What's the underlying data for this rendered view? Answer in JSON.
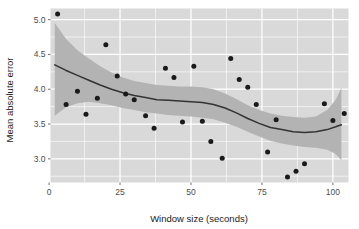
{
  "chart_data": {
    "type": "scatter",
    "title": "",
    "xlabel": "Window size (seconds)",
    "ylabel": "Mean absolute error",
    "xlim": [
      0.5,
      105.5
    ],
    "ylim": [
      2.66,
      5.16
    ],
    "xticks": [
      0,
      25,
      50,
      75,
      100
    ],
    "xticklabels": [
      "0",
      "25",
      "50",
      "75",
      "100"
    ],
    "yticks": [
      3.0,
      3.5,
      4.0,
      4.5,
      5.0
    ],
    "yticklabels": [
      "3.0",
      "3.5",
      "4.0",
      "4.5",
      "5.0"
    ],
    "x_minor_ticks": [
      12.5,
      37.5,
      62.5,
      87.5
    ],
    "y_minor_ticks": [
      2.75,
      3.25,
      3.75,
      4.25,
      4.75
    ],
    "grid": true,
    "legend": "none",
    "panel_background": "#d9d9d9",
    "gridline_color": "#ffffff",
    "point_color": "#1a1a1a",
    "line_color": "#333333",
    "ribbon_color": "#b3b3b3",
    "series": [
      {
        "name": "Mean absolute error",
        "points": [
          {
            "x": 3,
            "y": 5.08
          },
          {
            "x": 6,
            "y": 3.78
          },
          {
            "x": 10,
            "y": 3.97
          },
          {
            "x": 13,
            "y": 3.64
          },
          {
            "x": 17,
            "y": 3.87
          },
          {
            "x": 20,
            "y": 4.64
          },
          {
            "x": 24,
            "y": 4.19
          },
          {
            "x": 27,
            "y": 3.93
          },
          {
            "x": 30,
            "y": 3.85
          },
          {
            "x": 34,
            "y": 3.62
          },
          {
            "x": 37,
            "y": 3.44
          },
          {
            "x": 41,
            "y": 4.3
          },
          {
            "x": 44,
            "y": 4.17
          },
          {
            "x": 47,
            "y": 3.53
          },
          {
            "x": 51,
            "y": 4.33
          },
          {
            "x": 54,
            "y": 3.54
          },
          {
            "x": 57,
            "y": 3.25
          },
          {
            "x": 61,
            "y": 3.01
          },
          {
            "x": 64,
            "y": 4.44
          },
          {
            "x": 67,
            "y": 4.14
          },
          {
            "x": 70,
            "y": 4.03
          },
          {
            "x": 73,
            "y": 3.78
          },
          {
            "x": 77,
            "y": 3.1
          },
          {
            "x": 80,
            "y": 3.56
          },
          {
            "x": 84,
            "y": 2.74
          },
          {
            "x": 87,
            "y": 2.82
          },
          {
            "x": 90,
            "y": 2.93
          },
          {
            "x": 97,
            "y": 3.79
          },
          {
            "x": 100,
            "y": 3.55
          },
          {
            "x": 104,
            "y": 3.65
          }
        ],
        "smooth": [
          {
            "x": 2,
            "y": 4.35,
            "lo": 3.62,
            "hi": 4.95
          },
          {
            "x": 6,
            "y": 4.27,
            "lo": 3.74,
            "hi": 4.72
          },
          {
            "x": 10,
            "y": 4.2,
            "lo": 3.8,
            "hi": 4.56
          },
          {
            "x": 14,
            "y": 4.13,
            "lo": 3.82,
            "hi": 4.44
          },
          {
            "x": 18,
            "y": 4.06,
            "lo": 3.8,
            "hi": 4.33
          },
          {
            "x": 22,
            "y": 4.0,
            "lo": 3.77,
            "hi": 4.24
          },
          {
            "x": 26,
            "y": 3.95,
            "lo": 3.73,
            "hi": 4.17
          },
          {
            "x": 30,
            "y": 3.91,
            "lo": 3.7,
            "hi": 4.12
          },
          {
            "x": 34,
            "y": 3.88,
            "lo": 3.67,
            "hi": 4.09
          },
          {
            "x": 38,
            "y": 3.85,
            "lo": 3.65,
            "hi": 4.06
          },
          {
            "x": 42,
            "y": 3.84,
            "lo": 3.63,
            "hi": 4.05
          },
          {
            "x": 46,
            "y": 3.83,
            "lo": 3.62,
            "hi": 4.04
          },
          {
            "x": 50,
            "y": 3.82,
            "lo": 3.61,
            "hi": 4.04
          },
          {
            "x": 54,
            "y": 3.81,
            "lo": 3.59,
            "hi": 4.03
          },
          {
            "x": 58,
            "y": 3.78,
            "lo": 3.57,
            "hi": 4.0
          },
          {
            "x": 62,
            "y": 3.73,
            "lo": 3.52,
            "hi": 3.94
          },
          {
            "x": 66,
            "y": 3.66,
            "lo": 3.46,
            "hi": 3.86
          },
          {
            "x": 70,
            "y": 3.58,
            "lo": 3.39,
            "hi": 3.77
          },
          {
            "x": 74,
            "y": 3.51,
            "lo": 3.32,
            "hi": 3.7
          },
          {
            "x": 78,
            "y": 3.45,
            "lo": 3.26,
            "hi": 3.65
          },
          {
            "x": 82,
            "y": 3.42,
            "lo": 3.22,
            "hi": 3.62
          },
          {
            "x": 86,
            "y": 3.39,
            "lo": 3.19,
            "hi": 3.6
          },
          {
            "x": 90,
            "y": 3.38,
            "lo": 3.17,
            "hi": 3.59
          },
          {
            "x": 94,
            "y": 3.39,
            "lo": 3.16,
            "hi": 3.61
          },
          {
            "x": 98,
            "y": 3.42,
            "lo": 3.13,
            "hi": 3.7
          },
          {
            "x": 101,
            "y": 3.46,
            "lo": 3.07,
            "hi": 3.85
          },
          {
            "x": 103,
            "y": 3.49,
            "lo": 2.98,
            "hi": 4.02
          }
        ]
      }
    ]
  }
}
